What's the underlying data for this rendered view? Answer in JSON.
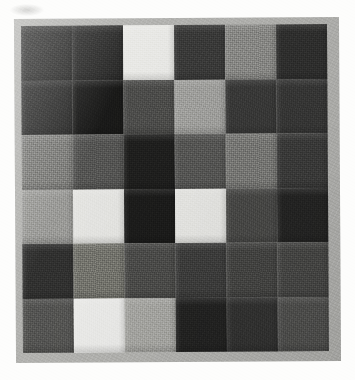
{
  "artwork": {
    "title": "Patchwork Quilt",
    "subject": "six-by-six grid of square fabric patches",
    "medium": "photograph of a pieced textile",
    "palette_note": "grayscale / monochrome fabric swatches",
    "rows": 6,
    "columns": 6,
    "border_color": "#b4b4b1",
    "page_background": "#fdfdfc"
  },
  "grid": {
    "cells": [
      [
        {
          "id": "r1c1",
          "row": 1,
          "col": 1,
          "tone": "very-dark",
          "color": "#2e2e2d"
        },
        {
          "id": "r1c2",
          "row": 1,
          "col": 2,
          "tone": "very-dark",
          "color": "#2a2a29"
        },
        {
          "id": "r1c3",
          "row": 1,
          "col": 3,
          "tone": "near-white",
          "color": "#e9e9e6"
        },
        {
          "id": "r1c4",
          "row": 1,
          "col": 4,
          "tone": "dark",
          "color": "#3b3b3a"
        },
        {
          "id": "r1c5",
          "row": 1,
          "col": 5,
          "tone": "medium",
          "color": "#8b8b88"
        },
        {
          "id": "r1c6",
          "row": 1,
          "col": 6,
          "tone": "very-dark",
          "color": "#30302f"
        }
      ],
      [
        {
          "id": "r2c1",
          "row": 2,
          "col": 1,
          "tone": "very-dark",
          "color": "#2c2c2b"
        },
        {
          "id": "r2c2",
          "row": 2,
          "col": 2,
          "tone": "blackest",
          "color": "#1a1a19"
        },
        {
          "id": "r2c3",
          "row": 2,
          "col": 3,
          "tone": "dark-medium",
          "color": "#4e4e4c"
        },
        {
          "id": "r2c4",
          "row": 2,
          "col": 4,
          "tone": "light-medium",
          "color": "#a2a29f"
        },
        {
          "id": "r2c5",
          "row": 2,
          "col": 5,
          "tone": "dark",
          "color": "#3a3a39"
        },
        {
          "id": "r2c6",
          "row": 2,
          "col": 6,
          "tone": "dark",
          "color": "#383837"
        }
      ],
      [
        {
          "id": "r3c1",
          "row": 3,
          "col": 1,
          "tone": "medium",
          "color": "#7e7e7b"
        },
        {
          "id": "r3c2",
          "row": 3,
          "col": 2,
          "tone": "dark-medium",
          "color": "#565654"
        },
        {
          "id": "r3c3",
          "row": 3,
          "col": 3,
          "tone": "blackest",
          "color": "#1f1f1e"
        },
        {
          "id": "r3c4",
          "row": 3,
          "col": 4,
          "tone": "dark-medium",
          "color": "#585856"
        },
        {
          "id": "r3c5",
          "row": 3,
          "col": 5,
          "tone": "medium",
          "color": "#7b7b78"
        },
        {
          "id": "r3c6",
          "row": 3,
          "col": 6,
          "tone": "dark",
          "color": "#3c3c3b"
        }
      ],
      [
        {
          "id": "r4c1",
          "row": 4,
          "col": 1,
          "tone": "light-medium",
          "color": "#9b9b98"
        },
        {
          "id": "r4c2",
          "row": 4,
          "col": 2,
          "tone": "near-white",
          "color": "#e5e5e2"
        },
        {
          "id": "r4c3",
          "row": 4,
          "col": 3,
          "tone": "blackest",
          "color": "#1c1c1b"
        },
        {
          "id": "r4c4",
          "row": 4,
          "col": 4,
          "tone": "near-white",
          "color": "#e7e7e4"
        },
        {
          "id": "r4c5",
          "row": 4,
          "col": 5,
          "tone": "dark-medium",
          "color": "#4a4a48"
        },
        {
          "id": "r4c6",
          "row": 4,
          "col": 6,
          "tone": "blackest",
          "color": "#252524"
        }
      ],
      [
        {
          "id": "r5c1",
          "row": 5,
          "col": 1,
          "tone": "very-dark",
          "color": "#313130"
        },
        {
          "id": "r5c2",
          "row": 5,
          "col": 2,
          "tone": "medium",
          "color": "#76766f"
        },
        {
          "id": "r5c3",
          "row": 5,
          "col": 3,
          "tone": "dark-medium",
          "color": "#4d4d4b"
        },
        {
          "id": "r5c4",
          "row": 5,
          "col": 4,
          "tone": "dark",
          "color": "#3e3e3d"
        },
        {
          "id": "r5c5",
          "row": 5,
          "col": 5,
          "tone": "dark-medium",
          "color": "#464644"
        },
        {
          "id": "r5c6",
          "row": 5,
          "col": 6,
          "tone": "dark-medium",
          "color": "#494947"
        }
      ],
      [
        {
          "id": "r6c1",
          "row": 6,
          "col": 1,
          "tone": "dark-medium",
          "color": "#565654"
        },
        {
          "id": "r6c2",
          "row": 6,
          "col": 2,
          "tone": "near-white",
          "color": "#ececea"
        },
        {
          "id": "r6c3",
          "row": 6,
          "col": 3,
          "tone": "light-medium",
          "color": "#a8a8a4"
        },
        {
          "id": "r6c4",
          "row": 6,
          "col": 4,
          "tone": "blackest",
          "color": "#232322"
        },
        {
          "id": "r6c5",
          "row": 6,
          "col": 5,
          "tone": "very-dark",
          "color": "#333332"
        },
        {
          "id": "r6c6",
          "row": 6,
          "col": 6,
          "tone": "dark-medium",
          "color": "#525250"
        }
      ]
    ]
  }
}
